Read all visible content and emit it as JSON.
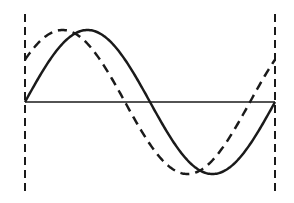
{
  "diagram": {
    "title": "",
    "colors": {
      "stroke": "#1a1a1a",
      "background": "#ffffff"
    },
    "axis": {
      "y": 102,
      "x_start": 25,
      "x_end": 275
    },
    "boundaries": [
      {
        "name": "left-boundary",
        "x": 25,
        "y_top": 14,
        "y_bottom": 192,
        "style": "dashed"
      },
      {
        "name": "right-boundary",
        "x": 275,
        "y_top": 14,
        "y_bottom": 192,
        "style": "dashed"
      }
    ],
    "waves": [
      {
        "name": "solid-wave",
        "style": "solid",
        "amplitude": 72,
        "phase_deg": 0
      },
      {
        "name": "dashed-wave",
        "style": "dashed",
        "amplitude": 72,
        "phase_deg": 36
      }
    ]
  }
}
